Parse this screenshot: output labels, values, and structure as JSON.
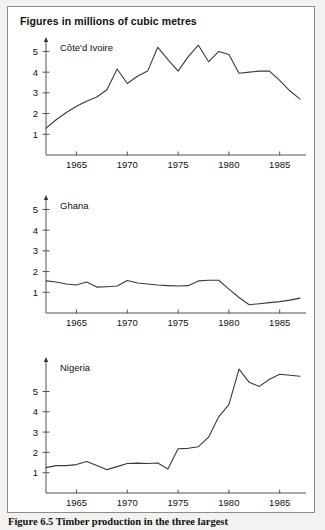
{
  "figure": {
    "title": "Figures in millions of cubic metres",
    "caption": "Figure 6.5  Timber production in the three largest"
  },
  "chart_data": [
    {
      "type": "line",
      "title": "Côte'd Ivoire",
      "panel_label": "Côte'd Ivoire",
      "xlabel": "",
      "ylabel": "",
      "xlim": [
        1962,
        1987
      ],
      "ylim": [
        0,
        5.6
      ],
      "xticks": [
        1965,
        1970,
        1975,
        1980,
        1985
      ],
      "yticks": [
        1,
        2,
        3,
        4,
        5
      ],
      "grid": false,
      "legend": "none",
      "x": [
        1962,
        1963,
        1964,
        1965,
        1966,
        1967,
        1968,
        1969,
        1970,
        1971,
        1972,
        1973,
        1974,
        1975,
        1976,
        1977,
        1978,
        1979,
        1980,
        1981,
        1982,
        1983,
        1984,
        1985,
        1986,
        1987
      ],
      "values": [
        1.3,
        1.7,
        2.05,
        2.35,
        2.6,
        2.8,
        3.15,
        4.15,
        3.45,
        3.8,
        4.05,
        5.2,
        4.6,
        4.05,
        4.75,
        5.3,
        4.5,
        5.0,
        4.85,
        3.95,
        4.0,
        4.05,
        4.05,
        3.6,
        3.1,
        2.7
      ]
    },
    {
      "type": "line",
      "title": "Ghana",
      "panel_label": "Ghana",
      "xlabel": "",
      "ylabel": "",
      "xlim": [
        1962,
        1987
      ],
      "ylim": [
        0,
        5.6
      ],
      "xticks": [
        1965,
        1970,
        1975,
        1980,
        1985
      ],
      "yticks": [
        1,
        2,
        3,
        4,
        5
      ],
      "grid": false,
      "legend": "none",
      "x": [
        1962,
        1963,
        1964,
        1965,
        1966,
        1967,
        1968,
        1969,
        1970,
        1971,
        1972,
        1973,
        1974,
        1975,
        1976,
        1977,
        1978,
        1979,
        1980,
        1981,
        1982,
        1983,
        1984,
        1985,
        1986,
        1987
      ],
      "values": [
        1.55,
        1.5,
        1.4,
        1.35,
        1.5,
        1.25,
        1.27,
        1.3,
        1.57,
        1.45,
        1.4,
        1.35,
        1.32,
        1.3,
        1.32,
        1.55,
        1.58,
        1.58,
        1.15,
        0.75,
        0.4,
        0.45,
        0.5,
        0.55,
        0.62,
        0.72
      ]
    },
    {
      "type": "line",
      "title": "Nigeria",
      "panel_label": "Nigeria",
      "xlabel": "",
      "ylabel": "",
      "xlim": [
        1962,
        1987
      ],
      "ylim": [
        0,
        6.6
      ],
      "xticks": [
        1965,
        1970,
        1975,
        1980,
        1985
      ],
      "yticks": [
        1,
        2,
        3,
        4,
        5
      ],
      "grid": false,
      "legend": "none",
      "x": [
        1962,
        1963,
        1964,
        1965,
        1966,
        1967,
        1968,
        1969,
        1970,
        1971,
        1972,
        1973,
        1974,
        1975,
        1976,
        1977,
        1978,
        1979,
        1980,
        1981,
        1982,
        1983,
        1984,
        1985,
        1986,
        1987
      ],
      "values": [
        1.25,
        1.35,
        1.35,
        1.4,
        1.55,
        1.35,
        1.15,
        1.3,
        1.45,
        1.47,
        1.45,
        1.48,
        1.18,
        2.18,
        2.2,
        2.28,
        2.75,
        3.75,
        4.35,
        6.1,
        5.45,
        5.25,
        5.6,
        5.85,
        5.8,
        5.75
      ]
    }
  ],
  "axis": {
    "tick_labels_x": [
      "1965",
      "1970",
      "1975",
      "1980",
      "1985"
    ],
    "tick_labels_y": [
      "1",
      "2",
      "3",
      "4",
      "5"
    ]
  }
}
